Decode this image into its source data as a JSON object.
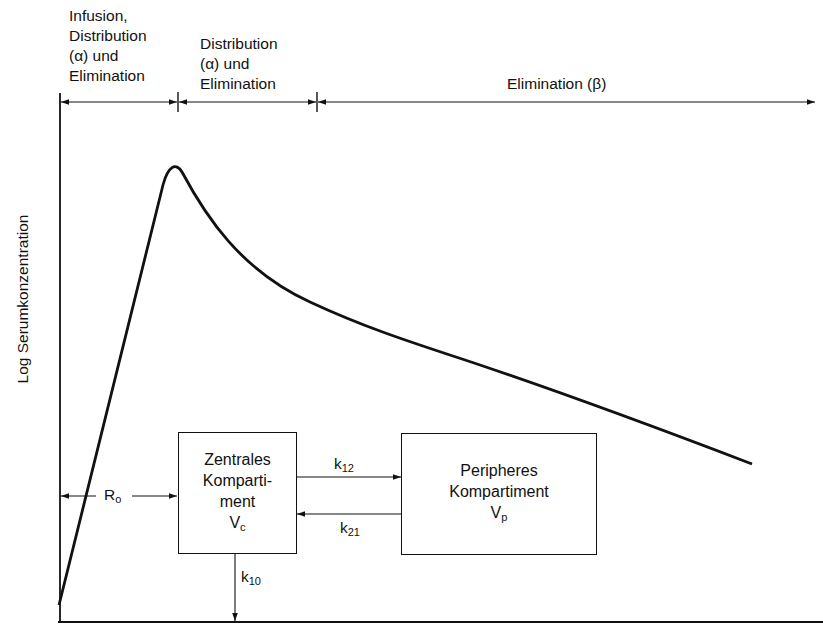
{
  "phases": [
    {
      "lines": [
        "Infusion,",
        "Distribution",
        "(α) und",
        "Elimination"
      ]
    },
    {
      "lines": [
        "Distribution",
        "(α) und",
        "Elimination"
      ]
    },
    {
      "label": "Elimination (β)"
    }
  ],
  "y_axis_label": "Log Serumkonzentration",
  "infusion_rate": {
    "symbol": "R",
    "sub": "o"
  },
  "central_compartment": {
    "lines": [
      "Zentrales",
      "Komparti-",
      "ment"
    ],
    "symbol": "V",
    "sub": "c"
  },
  "peripheral_compartment": {
    "lines": [
      "Peripheres",
      "Kompartiment"
    ],
    "symbol": "V",
    "sub": "p"
  },
  "rate_constants": {
    "k12": {
      "symbol": "k",
      "sub": "12"
    },
    "k21": {
      "symbol": "k",
      "sub": "21"
    },
    "k10": {
      "symbol": "k",
      "sub": "10"
    }
  },
  "colors": {
    "line": "#111111",
    "background": "#ffffff"
  }
}
